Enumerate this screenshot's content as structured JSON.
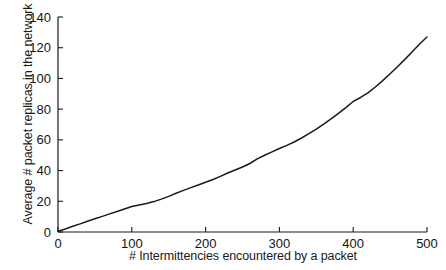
{
  "chart_data": {
    "type": "line",
    "title": "",
    "xlabel": "# Intermittencies encountered by a packet",
    "ylabel": "Average # packet replicas in the network",
    "xlim": [
      0,
      500
    ],
    "ylim": [
      0,
      140
    ],
    "xticks": [
      0,
      100,
      200,
      300,
      400,
      500
    ],
    "yticks": [
      0,
      20,
      40,
      60,
      80,
      100,
      120,
      140
    ],
    "xtick_labels": [
      "0",
      "100",
      "200",
      "300",
      "400",
      "500"
    ],
    "ytick_labels": [
      "0",
      "20",
      "40",
      "60",
      "80",
      "100",
      "120",
      "140"
    ],
    "grid": false,
    "legend": null,
    "line_color": "#1a1a1a",
    "series": [
      {
        "name": "Average # packet replicas",
        "x": [
          0,
          10,
          20,
          30,
          40,
          50,
          60,
          70,
          80,
          90,
          100,
          110,
          120,
          130,
          140,
          150,
          160,
          170,
          180,
          190,
          200,
          210,
          220,
          230,
          240,
          250,
          260,
          270,
          280,
          290,
          300,
          310,
          320,
          330,
          340,
          350,
          360,
          370,
          380,
          390,
          400,
          410,
          420,
          430,
          440,
          450,
          460,
          470,
          480,
          490,
          500
        ],
        "y": [
          0.5,
          2.0,
          3.7,
          5.3,
          7.0,
          8.6,
          10.2,
          11.8,
          13.3,
          15.0,
          16.6,
          17.6,
          18.6,
          19.8,
          21.4,
          23.2,
          25.2,
          27.1,
          28.9,
          30.6,
          32.4,
          34.2,
          36.2,
          38.4,
          40.4,
          42.3,
          44.6,
          47.6,
          50.0,
          52.2,
          54.4,
          56.4,
          58.6,
          61.2,
          64.0,
          67.0,
          70.2,
          73.6,
          77.2,
          81.0,
          85.0,
          87.6,
          90.6,
          94.4,
          98.6,
          103.0,
          107.6,
          112.4,
          117.4,
          122.4,
          127.0
        ]
      }
    ]
  },
  "axis": {
    "x_label_text": "# Intermittencies encountered by a packet",
    "y_label_text": "Average # packet replicas in the network"
  }
}
